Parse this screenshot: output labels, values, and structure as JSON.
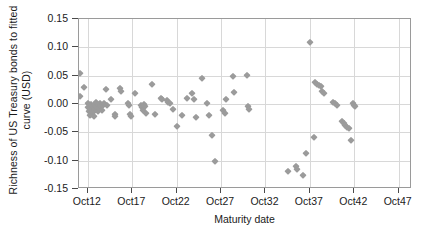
{
  "chart_data": {
    "type": "scatter",
    "title": "",
    "xlabel": "Maturity date",
    "ylabel": "Richness of US Treasury bonds to fitted curve (USD)",
    "ylabel_line1": "Richness of US Treasury bonds to fitted",
    "ylabel_line2": "curve (USD)",
    "xticklabels": [
      "Oct12",
      "Oct17",
      "Oct22",
      "Oct27",
      "Oct32",
      "Oct37",
      "Oct42",
      "Oct47"
    ],
    "xtickvalues": [
      12,
      17,
      22,
      27,
      32,
      37,
      42,
      47
    ],
    "yticklabels": [
      "0.15",
      "0.10",
      "0.05",
      "0.00",
      "-0.05",
      "-0.10",
      "-0.15"
    ],
    "ytickvalues": [
      0.15,
      0.1,
      0.05,
      0.0,
      -0.05,
      -0.1,
      -0.15
    ],
    "xlim": [
      11.0,
      48.5
    ],
    "ylim": [
      -0.15,
      0.15
    ],
    "grid": true,
    "legend": null,
    "marker": "diamond",
    "marker_color": "#9b9b9b",
    "axis_color": "#9a9a9a",
    "grid_color": "#d8d8d8",
    "points": [
      [
        11.1,
        0.055
      ],
      [
        11.1,
        0.014
      ],
      [
        11.6,
        0.03
      ],
      [
        12.0,
        0.001
      ],
      [
        12.0,
        -0.006
      ],
      [
        12.1,
        -0.013
      ],
      [
        12.2,
        -0.02
      ],
      [
        12.3,
        -0.004
      ],
      [
        12.3,
        -0.011
      ],
      [
        12.4,
        -0.017
      ],
      [
        12.4,
        0.0
      ],
      [
        12.5,
        -0.008
      ],
      [
        12.6,
        -0.003
      ],
      [
        12.6,
        -0.014
      ],
      [
        12.7,
        -0.022
      ],
      [
        12.8,
        -0.002
      ],
      [
        12.9,
        -0.009
      ],
      [
        12.9,
        0.003
      ],
      [
        13.0,
        -0.005
      ],
      [
        13.1,
        -0.012
      ],
      [
        13.2,
        -0.001
      ],
      [
        13.3,
        -0.007
      ],
      [
        13.4,
        0.002
      ],
      [
        13.5,
        -0.004
      ],
      [
        13.6,
        -0.01
      ],
      [
        13.7,
        -0.002
      ],
      [
        13.8,
        0.001
      ],
      [
        14.0,
        0.027
      ],
      [
        14.2,
        -0.001
      ],
      [
        14.6,
        0.009
      ],
      [
        15.0,
        -0.018
      ],
      [
        15.1,
        -0.021
      ],
      [
        15.6,
        0.028
      ],
      [
        15.7,
        0.023
      ],
      [
        16.5,
        0.002
      ],
      [
        16.6,
        -0.002
      ],
      [
        16.7,
        -0.018
      ],
      [
        16.8,
        -0.021
      ],
      [
        17.3,
        0.019
      ],
      [
        18.0,
        -0.002
      ],
      [
        18.1,
        -0.006
      ],
      [
        18.2,
        -0.01
      ],
      [
        18.3,
        0.0
      ],
      [
        18.4,
        -0.004
      ],
      [
        18.6,
        -0.016
      ],
      [
        19.2,
        0.035
      ],
      [
        19.6,
        -0.017
      ],
      [
        20.2,
        0.01
      ],
      [
        20.4,
        0.008
      ],
      [
        20.9,
        0.007
      ],
      [
        21.0,
        0.003
      ],
      [
        21.2,
        0.001
      ],
      [
        21.6,
        -0.008
      ],
      [
        22.0,
        -0.038
      ],
      [
        22.6,
        -0.019
      ],
      [
        23.2,
        0.011
      ],
      [
        23.7,
        0.02
      ],
      [
        24.0,
        0.009
      ],
      [
        24.2,
        -0.023
      ],
      [
        24.9,
        0.046
      ],
      [
        25.4,
        0.002
      ],
      [
        25.6,
        -0.02
      ],
      [
        26.0,
        -0.055
      ],
      [
        26.3,
        -0.101
      ],
      [
        27.2,
        -0.011
      ],
      [
        27.4,
        -0.015
      ],
      [
        27.6,
        0.009
      ],
      [
        28.3,
        0.05
      ],
      [
        28.5,
        0.021
      ],
      [
        29.9,
        0.052
      ],
      [
        30.0,
        -0.004
      ],
      [
        30.2,
        -0.008
      ],
      [
        34.5,
        -0.118
      ],
      [
        35.4,
        -0.11
      ],
      [
        35.6,
        -0.114
      ],
      [
        36.2,
        -0.125
      ],
      [
        36.6,
        -0.086
      ],
      [
        37.0,
        0.11
      ],
      [
        37.5,
        -0.059
      ],
      [
        37.6,
        0.038
      ],
      [
        37.8,
        0.036
      ],
      [
        38.0,
        0.034
      ],
      [
        38.2,
        0.031
      ],
      [
        38.4,
        0.023
      ],
      [
        38.6,
        0.02
      ],
      [
        39.6,
        0.004
      ],
      [
        39.8,
        0.001
      ],
      [
        40.0,
        -0.002
      ],
      [
        40.6,
        -0.03
      ],
      [
        40.8,
        -0.034
      ],
      [
        41.0,
        -0.037
      ],
      [
        41.2,
        -0.04
      ],
      [
        41.4,
        -0.043
      ],
      [
        41.6,
        -0.063
      ],
      [
        41.8,
        0.002
      ],
      [
        42.0,
        -0.001
      ],
      [
        42.1,
        -0.004
      ]
    ]
  }
}
